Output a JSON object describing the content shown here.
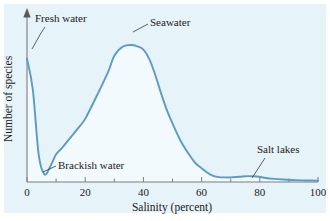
{
  "chart_data": {
    "type": "line",
    "title": "",
    "xlabel": "Salinity (percent)",
    "ylabel": "Number of species",
    "xlim": [
      0,
      100
    ],
    "ylim": [
      0,
      100
    ],
    "grid": false,
    "legend": "none",
    "xticks": [
      0,
      20,
      40,
      60,
      80,
      100
    ],
    "xtick_labels": [
      "0",
      "20",
      "40",
      "60",
      "80",
      "100"
    ],
    "xminor_ticks": [
      10,
      30,
      50,
      70,
      90
    ],
    "yticks": [],
    "ytick_labels": [],
    "series": [
      {
        "name": "Number of species vs salinity",
        "color": "#5b9bc4",
        "x": [
          0,
          2,
          4,
          6,
          8,
          10,
          12,
          15,
          18,
          20,
          24,
          28,
          30,
          33,
          36,
          38,
          40,
          42,
          44,
          46,
          48,
          50,
          53,
          56,
          58,
          60,
          62,
          64,
          66,
          68,
          70,
          73,
          76,
          79,
          82,
          85,
          88,
          92,
          96,
          100
        ],
        "values": [
          80,
          60,
          18,
          5,
          10,
          18,
          22,
          29,
          36,
          41,
          56,
          72,
          82,
          88,
          89,
          88,
          86,
          80,
          70,
          58,
          47,
          38,
          26,
          17,
          12,
          9,
          6,
          4,
          3.2,
          3,
          3,
          3.4,
          3.8,
          3.6,
          2.6,
          2,
          1.6,
          1.2,
          1,
          0.8
        ]
      }
    ],
    "annotations": [
      {
        "id": "fresh-water",
        "label": "Fresh water"
      },
      {
        "id": "seawater",
        "label": "Seawater"
      },
      {
        "id": "brackish-water",
        "label": "Brackish water"
      },
      {
        "id": "salt-lakes",
        "label": "Salt lakes"
      }
    ]
  },
  "colors": {
    "background": "#e6f3f8",
    "curve": "#5b9bc4",
    "curve_fill": "#f2fafd",
    "axis": "#7c7c7c",
    "text": "#1b1b1b",
    "leader": "#3a3a3a"
  },
  "axes": {
    "x_title": "Salinity (percent)",
    "y_title": "Number of species",
    "x_labels": [
      "0",
      "20",
      "40",
      "60",
      "80",
      "100"
    ]
  },
  "annotations": {
    "fresh_water": "Fresh water",
    "seawater": "Seawater",
    "brackish_water": "Brackish water",
    "salt_lakes": "Salt lakes"
  }
}
